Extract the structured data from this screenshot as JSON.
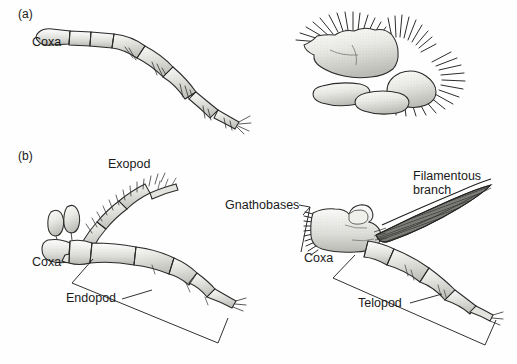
{
  "figure": {
    "background_color": "#fefefe",
    "ink_color": "#1a1a1a",
    "limb_fill": "#e8e8e6",
    "width": 517,
    "height": 364
  },
  "panels": [
    {
      "id": "a",
      "label": "(a)",
      "caption_labels": [
        "Coxa"
      ],
      "specimens": [
        {
          "name": "stenopodous-limb",
          "type": "stenopodium",
          "description": "slender segmented walking limb with sparse setae",
          "segment_count": 7,
          "labels": [
            {
              "text": "Coxa",
              "x": 32,
              "y": 46
            }
          ]
        },
        {
          "name": "phyllopodous-limb",
          "type": "phyllopodium",
          "description": "broad flattened lobate limb fringed with dense setae",
          "lobe_count": 5,
          "labels": []
        }
      ]
    },
    {
      "id": "b",
      "label": "(b)",
      "caption_labels": [
        "Exopod",
        "Coxa",
        "Endopod",
        "Gnathobases",
        "Filamentous branch",
        "Telopod"
      ],
      "specimens": [
        {
          "name": "biramous-limb-left",
          "type": "biramous",
          "description": "biramous limb with exopod, endopod and epipod lobes",
          "labels": [
            {
              "text": "Exopod",
              "x": 108,
              "y": 168
            },
            {
              "text": "Coxa",
              "x": 32,
              "y": 266
            },
            {
              "text": "Endopod",
              "x": 66,
              "y": 302
            }
          ]
        },
        {
          "name": "biramous-limb-right",
          "type": "biramous-gnathobasic",
          "description": "biramous limb with gnathobases, filamentous branch and telopod",
          "labels": [
            {
              "text": "Gnathobases",
              "x": 225,
              "y": 205
            },
            {
              "text": "Filamentous",
              "x": 413,
              "y": 180
            },
            {
              "text": "branch",
              "x": 413,
              "y": 194
            },
            {
              "text": "Coxa",
              "x": 304,
              "y": 262
            },
            {
              "text": "Telopod",
              "x": 358,
              "y": 307
            }
          ]
        }
      ]
    }
  ],
  "labels": {
    "panel_a": "(a)",
    "panel_b": "(b)",
    "coxa_a": "Coxa",
    "exopod": "Exopod",
    "coxa_b_left": "Coxa",
    "endopod": "Endopod",
    "gnathobases": "Gnathobases",
    "filamentous_line1": "Filamentous",
    "filamentous_line2": "branch",
    "coxa_b_right": "Coxa",
    "telopod": "Telopod"
  }
}
